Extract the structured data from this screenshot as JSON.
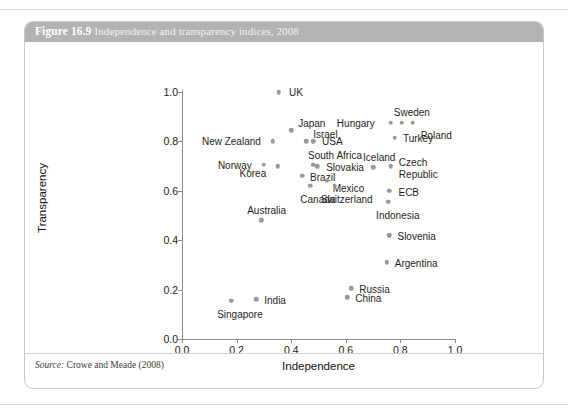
{
  "figure": {
    "number": "Figure 16.9",
    "caption": "Independence and transparency indices, 2008",
    "source": "Source:",
    "source_text": " Crowe and Meade (2008)"
  },
  "chart_data": {
    "type": "scatter",
    "title": "Independence and transparency indices, 2008",
    "xlabel": "Independence",
    "ylabel": "Transparency",
    "xlim": [
      0.0,
      1.0
    ],
    "ylim": [
      0.0,
      1.0
    ],
    "xticks": [
      "0.0",
      "0.2",
      "0.4",
      "0.6",
      "0.8",
      "1.0"
    ],
    "yticks": [
      "0.0",
      "0.2",
      "0.4",
      "0.6",
      "0.8",
      "1.0"
    ],
    "grid": false,
    "legend": "none",
    "marker_color": "#9a9a9a",
    "points": [
      {
        "name": "UK",
        "x": 0.355,
        "y": 1.0,
        "lx": 10,
        "ly": -4
      },
      {
        "name": "Sweden",
        "x": 0.805,
        "y": 0.875,
        "lx": -8,
        "ly": -15
      },
      {
        "name": "Hungary",
        "x": 0.765,
        "y": 0.875,
        "lx": -54,
        "ly": -4
      },
      {
        "name": "Poland",
        "x": 0.845,
        "y": 0.875,
        "lx": 8,
        "ly": 8
      },
      {
        "name": "Turkey",
        "x": 0.78,
        "y": 0.815,
        "lx": 8,
        "ly": -4
      },
      {
        "name": "Japan",
        "x": 0.4,
        "y": 0.845,
        "lx": 7,
        "ly": -11
      },
      {
        "name": "Israel",
        "x": 0.455,
        "y": 0.8,
        "lx": 7,
        "ly": -11
      },
      {
        "name": "New Zealand",
        "x": 0.333,
        "y": 0.8,
        "lx": -71,
        "ly": -4
      },
      {
        "name": "USA",
        "x": 0.48,
        "y": 0.8,
        "lx": 9,
        "ly": -4
      },
      {
        "name": "South Africa",
        "x": 0.48,
        "y": 0.705,
        "lx": -5,
        "ly": -14
      },
      {
        "name": "Slovakia",
        "x": 0.495,
        "y": 0.7,
        "lx": 9,
        "ly": -3
      },
      {
        "name": "Iceland",
        "x": 0.7,
        "y": 0.695,
        "lx": -10,
        "ly": -14
      },
      {
        "name": "Czech Republic",
        "x": 0.765,
        "y": 0.7,
        "lx": 8,
        "ly": -9
      },
      {
        "name": "Norway",
        "x": 0.3,
        "y": 0.705,
        "lx": -46,
        "ly": -4
      },
      {
        "name": "Korea",
        "x": 0.35,
        "y": 0.7,
        "lx": -38,
        "ly": 3
      },
      {
        "name": "Brazil",
        "x": 0.44,
        "y": 0.66,
        "lx": 8,
        "ly": -3
      },
      {
        "name": "Mexico",
        "x": 0.53,
        "y": 0.64,
        "lx": 6,
        "ly": 3
      },
      {
        "name": "ECB",
        "x": 0.76,
        "y": 0.6,
        "lx": 9,
        "ly": -3
      },
      {
        "name": "Canada",
        "x": 0.47,
        "y": 0.62,
        "lx": -10,
        "ly": 9
      },
      {
        "name": "Switzerland",
        "x": 0.56,
        "y": 0.62,
        "lx": -14,
        "ly": 9
      },
      {
        "name": "Indonesia",
        "x": 0.755,
        "y": 0.555,
        "lx": -12,
        "ly": 9
      },
      {
        "name": "Australia",
        "x": 0.29,
        "y": 0.48,
        "lx": -14,
        "ly": -14
      },
      {
        "name": "Slovenia",
        "x": 0.76,
        "y": 0.42,
        "lx": 8,
        "ly": -3
      },
      {
        "name": "Argentina",
        "x": 0.75,
        "y": 0.31,
        "lx": 8,
        "ly": -3
      },
      {
        "name": "Russia",
        "x": 0.62,
        "y": 0.205,
        "lx": 8,
        "ly": -3
      },
      {
        "name": "China",
        "x": 0.605,
        "y": 0.17,
        "lx": 8,
        "ly": -3
      },
      {
        "name": "India",
        "x": 0.272,
        "y": 0.16,
        "lx": 8,
        "ly": -3
      },
      {
        "name": "Singapore",
        "x": 0.18,
        "y": 0.155,
        "lx": -14,
        "ly": 9
      }
    ]
  }
}
